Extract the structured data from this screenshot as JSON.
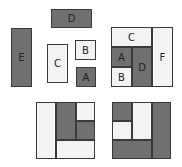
{
  "colors": {
    "dark": "#707070",
    "light": "#f3f3f3",
    "border": "#3a3a3a"
  },
  "loose_pieces": [
    {
      "label": "D",
      "shade": "dark",
      "x": 51,
      "y": 9,
      "w": 41,
      "h": 19
    },
    {
      "label": "E",
      "shade": "dark",
      "x": 11,
      "y": 28,
      "w": 21,
      "h": 59
    },
    {
      "label": "C",
      "shade": "light",
      "x": 47,
      "y": 44,
      "w": 21,
      "h": 39
    },
    {
      "label": "B",
      "shade": "light",
      "x": 75,
      "y": 40,
      "w": 21,
      "h": 20
    },
    {
      "label": "A",
      "shade": "dark",
      "x": 76,
      "y": 67,
      "w": 20,
      "h": 20
    }
  ],
  "assembled_square": [
    {
      "label": "C",
      "shade": "light",
      "x": 111,
      "y": 27,
      "w": 41,
      "h": 20
    },
    {
      "label": "A",
      "shade": "dark",
      "x": 111,
      "y": 47,
      "w": 21,
      "h": 20
    },
    {
      "label": "B",
      "shade": "light",
      "x": 111,
      "y": 67,
      "w": 21,
      "h": 20
    },
    {
      "label": "D",
      "shade": "dark",
      "x": 132,
      "y": 47,
      "w": 20,
      "h": 40
    },
    {
      "label": "F",
      "shade": "light",
      "x": 152,
      "y": 27,
      "w": 21,
      "h": 60
    }
  ],
  "bottom_left_square": [
    {
      "label": "",
      "shade": "light",
      "x": 36,
      "y": 102,
      "w": 20,
      "h": 57
    },
    {
      "label": "",
      "shade": "dark",
      "x": 56,
      "y": 102,
      "w": 20,
      "h": 38
    },
    {
      "label": "",
      "shade": "light",
      "x": 76,
      "y": 102,
      "w": 19,
      "h": 19
    },
    {
      "label": "",
      "shade": "dark",
      "x": 76,
      "y": 121,
      "w": 19,
      "h": 19
    },
    {
      "label": "",
      "shade": "light",
      "x": 56,
      "y": 140,
      "w": 39,
      "h": 19
    }
  ],
  "bottom_right_square": [
    {
      "label": "",
      "shade": "dark",
      "x": 112,
      "y": 102,
      "w": 20,
      "h": 19
    },
    {
      "label": "",
      "shade": "light",
      "x": 112,
      "y": 121,
      "w": 20,
      "h": 19
    },
    {
      "label": "",
      "shade": "light",
      "x": 132,
      "y": 102,
      "w": 20,
      "h": 38
    },
    {
      "label": "",
      "shade": "dark",
      "x": 152,
      "y": 102,
      "w": 19,
      "h": 57
    },
    {
      "label": "",
      "shade": "dark",
      "x": 112,
      "y": 140,
      "w": 40,
      "h": 19
    }
  ]
}
